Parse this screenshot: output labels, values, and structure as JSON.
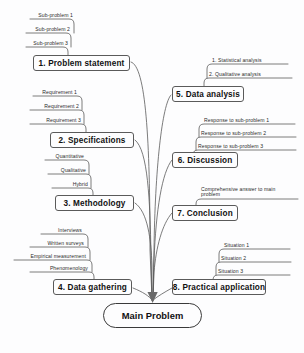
{
  "diagram": {
    "root": {
      "label": "Main Problem"
    },
    "colors": {
      "background": "#fdfdfe",
      "stroke": "#5a5a5a",
      "root_stroke": "#3a3a3a",
      "text": "#111111",
      "leaf_text": "#2a2a2a"
    },
    "branches": [
      {
        "id": "problem-statement",
        "label": "1. Problem statement",
        "side": "left",
        "children": [
          "Sub-problem 1",
          "Sub-problem 2",
          "Sub-problem 3"
        ]
      },
      {
        "id": "specifications",
        "label": "2. Specifications",
        "side": "left",
        "children": [
          "Requirement 1",
          "Requirement 2",
          "Requirement 3"
        ]
      },
      {
        "id": "methodology",
        "label": "3. Methodology",
        "side": "left",
        "children": [
          "Quantitative",
          "Qualitative",
          "Hybrid"
        ]
      },
      {
        "id": "data-gathering",
        "label": "4. Data gathering",
        "side": "left",
        "children": [
          "Interviews",
          "Written surveys",
          "Empirical measurement",
          "Phenomenology"
        ]
      },
      {
        "id": "data-analysis",
        "label": "5. Data analysis",
        "side": "right",
        "children": [
          "1. Statistical analysis",
          "2. Qualitative analysis"
        ]
      },
      {
        "id": "discussion",
        "label": "6. Discussion",
        "side": "right",
        "children": [
          "Response to sub-problem 1",
          "Response to sub-problem 2",
          "Response to sub-problem 3"
        ]
      },
      {
        "id": "conclusion",
        "label": "7. Conclusion",
        "side": "right",
        "children": [
          "Comprehensive answer to main problem"
        ]
      },
      {
        "id": "practical-application",
        "label": "8. Practical application",
        "side": "right",
        "children": [
          "Situation 1",
          "Situation 2",
          "Situation 3"
        ]
      }
    ]
  }
}
